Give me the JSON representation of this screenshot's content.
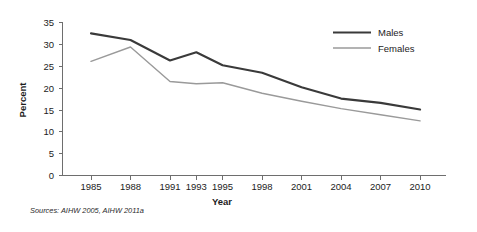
{
  "chart_data": {
    "type": "line",
    "title": "",
    "xlabel": "Year",
    "ylabel": "Percent",
    "categories": [
      "1985",
      "1988",
      "1991",
      "1993",
      "1995",
      "1998",
      "2001",
      "2004",
      "2007",
      "2010"
    ],
    "series": [
      {
        "name": "Males",
        "color": "#3a3a3a",
        "values": [
          32.5,
          31.0,
          26.3,
          28.2,
          25.2,
          23.5,
          20.2,
          17.6,
          16.6,
          15.1
        ]
      },
      {
        "name": "Females",
        "color": "#9a9a9a",
        "values": [
          26.1,
          29.4,
          21.5,
          21.0,
          21.2,
          18.8,
          17.0,
          15.3,
          13.9,
          12.5
        ]
      }
    ],
    "ylim": [
      0,
      35
    ],
    "ytick_values": [
      "35",
      "30",
      "25",
      "20",
      "15",
      "10",
      "5",
      "0"
    ],
    "ytick_step": 5,
    "grid": false,
    "legend_position": "top-right",
    "legend_entries": [
      {
        "label": "Males",
        "color": "#3a3a3a"
      },
      {
        "label": "Females",
        "color": "#9a9a9a"
      }
    ],
    "source_note": "Sources: AIHW 2005, AIHW 2011a"
  },
  "axis": {
    "y_label": "Percent",
    "x_label": "Year"
  },
  "ticks": {
    "y": [
      "35",
      "30",
      "25",
      "20",
      "15",
      "10",
      "5",
      "0"
    ],
    "x": [
      "1985",
      "1988",
      "1991",
      "1993",
      "1995",
      "1998",
      "2001",
      "2004",
      "2007",
      "2010"
    ]
  },
  "legend": {
    "males": "Males",
    "females": "Females"
  },
  "footer": {
    "sources": "Sources: AIHW 2005, AIHW 2011a"
  },
  "colors": {
    "males_line": "#3a3a3a",
    "females_line": "#9a9a9a",
    "axis": "#6e6e6e",
    "background": "#ffffff"
  }
}
